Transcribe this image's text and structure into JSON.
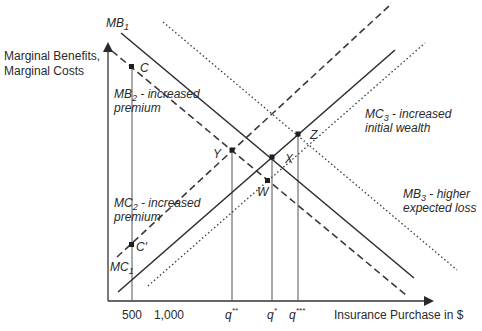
{
  "diagram": {
    "y_axis_label_line1": "Marginal Benefits,",
    "y_axis_label_line2": "Marginal Costs",
    "x_axis_label": "Insurance Purchase in $",
    "x_ticks": {
      "t500": "500",
      "t1000": "1,000",
      "q_double_star": "q",
      "q_double_star_sup": "**",
      "q_star": "q",
      "q_star_sup": "*",
      "q_triple_star": "q",
      "q_triple_star_sup": "***"
    },
    "curves": {
      "mb1": {
        "name": "MB",
        "sub": "1",
        "style": "solid"
      },
      "mb2": {
        "name": "MB",
        "sub": "2",
        "desc_line1": " - increased",
        "desc_line2": "premium",
        "style": "dashed"
      },
      "mb3": {
        "name": "MB",
        "sub": "3",
        "desc_line1": " - higher",
        "desc_line2": "expected loss",
        "style": "dotted"
      },
      "mc1": {
        "name": "MC",
        "sub": "1",
        "style": "solid"
      },
      "mc2": {
        "name": "MC",
        "sub": "2",
        "desc_line1": " - increased",
        "desc_line2": "premium",
        "style": "dashed"
      },
      "mc3": {
        "name": "MC",
        "sub": "3",
        "desc_line1": " - increased",
        "desc_line2": "initial wealth",
        "style": "dotted"
      }
    },
    "points": {
      "c": "C",
      "c_prime": "C′",
      "y": "Y",
      "x": "X",
      "w": "W",
      "z": "Z"
    }
  }
}
